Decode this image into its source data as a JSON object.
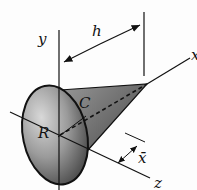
{
  "diagram": {
    "labels": {
      "y_axis": "y",
      "z_axis": "z",
      "x_axis": "x",
      "height": "h",
      "radius": "R",
      "centroid": "C",
      "centroid_offset": "x̄"
    },
    "colors": {
      "line": "#111111",
      "cone_dark": "#3a3a3a",
      "cone_mid": "#7a7a7a",
      "cone_light": "#c8c8c8",
      "background": "#fdfdfd"
    }
  }
}
